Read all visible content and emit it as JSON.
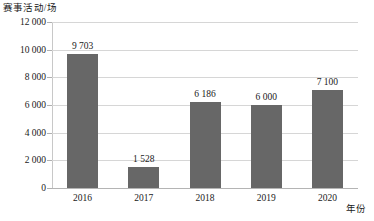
{
  "chart_data": {
    "type": "bar",
    "title": "",
    "ylabel": "赛事活动/场",
    "xlabel": "年份",
    "categories": [
      "2016",
      "2017",
      "2018",
      "2019",
      "2020"
    ],
    "values": [
      9703,
      1528,
      6186,
      6000,
      7100
    ],
    "value_labels": [
      "9 703",
      "1 528",
      "6 186",
      "6 000",
      "7 100"
    ],
    "ylim": [
      0,
      12000
    ],
    "yticks": [
      0,
      2000,
      4000,
      6000,
      8000,
      10000,
      12000
    ],
    "ytick_labels": [
      "0",
      "2 000",
      "4 000",
      "6 000",
      "8 000",
      "10 000",
      "12 000"
    ],
    "grid": true,
    "legend": false,
    "bar_color": "#676767",
    "gridline_color": "#d6d6d6",
    "axis_color": "#b4b4b4",
    "background": "#ffffff"
  }
}
